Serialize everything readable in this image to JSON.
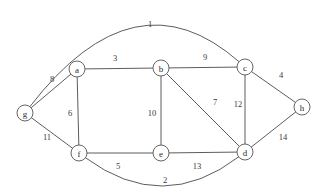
{
  "figure": {
    "type": "undirected-weighted-graph",
    "background_color": "#ffffff",
    "line_color": "#4a4a4a",
    "text_color": "#2b2b2b",
    "width": 328,
    "height": 196
  },
  "chart_data": {
    "type": "diagram",
    "title": "",
    "nodes": [
      {
        "id": "g",
        "label": "g",
        "x": 25,
        "y": 113,
        "r": 8
      },
      {
        "id": "a",
        "label": "a",
        "x": 77,
        "y": 69,
        "r": 8
      },
      {
        "id": "b",
        "label": "b",
        "x": 161,
        "y": 68,
        "r": 8
      },
      {
        "id": "c",
        "label": "c",
        "x": 245,
        "y": 67,
        "r": 8
      },
      {
        "id": "h",
        "label": "h",
        "x": 302,
        "y": 107,
        "r": 8
      },
      {
        "id": "d",
        "label": "d",
        "x": 245,
        "y": 152,
        "r": 8
      },
      {
        "id": "e",
        "label": "e",
        "x": 161,
        "y": 153,
        "r": 8
      },
      {
        "id": "f",
        "label": "f",
        "x": 79,
        "y": 153,
        "r": 8
      }
    ],
    "edges": [
      {
        "from": "g",
        "to": "c",
        "weight": "1",
        "shape": "curve",
        "curve_cx": 135,
        "curve_cy": -30,
        "label_x": 150,
        "label_y": 24
      },
      {
        "from": "f",
        "to": "d",
        "weight": "2",
        "shape": "curve",
        "curve_cx": 163,
        "curve_cy": 215,
        "label_x": 165,
        "label_y": 180
      },
      {
        "from": "a",
        "to": "b",
        "weight": "3",
        "shape": "line",
        "label_x": 115,
        "label_y": 58
      },
      {
        "from": "c",
        "to": "h",
        "weight": "4",
        "shape": "line",
        "label_x": 281,
        "label_y": 75
      },
      {
        "from": "f",
        "to": "e",
        "weight": "5",
        "shape": "line",
        "label_x": 118,
        "label_y": 166
      },
      {
        "from": "a",
        "to": "f",
        "weight": "6",
        "shape": "line",
        "label_x": 70,
        "label_y": 113
      },
      {
        "from": "b",
        "to": "d",
        "weight": "7",
        "shape": "line",
        "label_x": 215,
        "label_y": 102
      },
      {
        "from": "g",
        "to": "a",
        "weight": "8",
        "shape": "line",
        "label_x": 52,
        "label_y": 79
      },
      {
        "from": "b",
        "to": "c",
        "weight": "9",
        "shape": "line",
        "label_x": 205,
        "label_y": 57
      },
      {
        "from": "b",
        "to": "e",
        "weight": "10",
        "shape": "line",
        "label_x": 152,
        "label_y": 113
      },
      {
        "from": "g",
        "to": "f",
        "weight": "11",
        "shape": "line",
        "label_x": 47,
        "label_y": 137
      },
      {
        "from": "c",
        "to": "d",
        "weight": "12",
        "shape": "line",
        "label_x": 238,
        "label_y": 104
      },
      {
        "from": "e",
        "to": "d",
        "weight": "13",
        "shape": "line",
        "label_x": 197,
        "label_y": 166
      },
      {
        "from": "d",
        "to": "h",
        "weight": "14",
        "shape": "line",
        "label_x": 283,
        "label_y": 137
      }
    ]
  }
}
